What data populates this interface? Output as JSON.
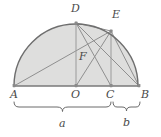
{
  "figure": {
    "kind": "geometry-diagram",
    "colors": {
      "fill": "#dededd",
      "arc_stroke": "#6e6e6e",
      "line_stroke": "#8a8a8a",
      "baseline_stroke": "#7a7a7a",
      "label_text": "#4a4a4a",
      "brace_stroke": "#6a6a6a",
      "background": "#ffffff"
    },
    "points": [
      {
        "id": "A",
        "label": "A",
        "x": 14,
        "y": 86,
        "label_x": 10,
        "label_y": 89
      },
      {
        "id": "O",
        "label": "O",
        "x": 76,
        "y": 86,
        "label_x": 71,
        "label_y": 89
      },
      {
        "id": "C",
        "label": "C",
        "x": 111,
        "y": 86,
        "label_x": 106,
        "label_y": 89
      },
      {
        "id": "B",
        "label": "B",
        "x": 139,
        "y": 86,
        "label_x": 141,
        "label_y": 89
      },
      {
        "id": "D",
        "label": "D",
        "x": 76,
        "y": 23,
        "label_x": 71,
        "label_y": 3
      },
      {
        "id": "E",
        "label": "E",
        "x": 111,
        "y": 31,
        "label_x": 112,
        "label_y": 9
      },
      {
        "id": "F",
        "label": "F",
        "x": 90,
        "y": 60,
        "label_x": 79,
        "label_y": 51
      }
    ],
    "segments": [
      {
        "name": "diameter-AB",
        "from": "A",
        "to": "B"
      },
      {
        "name": "chord-A-E",
        "from": "A",
        "to": "E"
      },
      {
        "name": "chord-D-B",
        "from": "D",
        "to": "B"
      },
      {
        "name": "chord-D-C",
        "from": "D",
        "to": "C"
      },
      {
        "name": "segment-D-O",
        "from": "D",
        "to": "O"
      },
      {
        "name": "segment-E-C",
        "from": "E",
        "to": "C"
      },
      {
        "name": "segment-E-O",
        "from": "E",
        "to": "O"
      },
      {
        "name": "segment-D-E",
        "from": "D",
        "to": "E"
      },
      {
        "name": "segment-E-B",
        "from": "E",
        "to": "B"
      }
    ],
    "arc": {
      "name": "semicircle-arc",
      "center_x": 76,
      "center_y": 86,
      "radius": 62,
      "start_deg": 180,
      "end_deg": 0
    },
    "braces": [
      {
        "id": "a",
        "label": "a",
        "from_x": 14,
        "to_x": 111,
        "y": 107,
        "label_x": 61,
        "label_y": 119
      },
      {
        "id": "b",
        "label": "b",
        "from_x": 113,
        "to_x": 140,
        "y": 107,
        "label_x": 123,
        "label_y": 117
      }
    ]
  }
}
